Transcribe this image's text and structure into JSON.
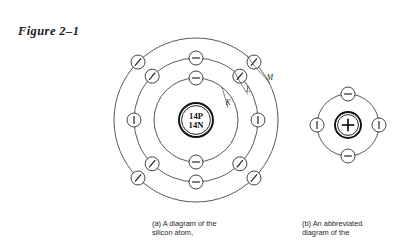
{
  "figure": {
    "label": "Figure 2–1"
  },
  "chart_data": {
    "type": "diagram",
    "title": "Figure 2–1",
    "subject": "silicon atom",
    "panels": [
      {
        "id": "a",
        "caption": "(a) A diagram of the\nsilicon atom,",
        "center": {
          "x": 196,
          "y": 120
        },
        "nucleus": {
          "line1": "14P",
          "line2": "14N",
          "radius": 17,
          "protons": 14,
          "neutrons": 14
        },
        "shells": [
          {
            "name": "K",
            "radius": 42,
            "electron_count": 2,
            "label": "K",
            "label_x": 228,
            "label_y": 105,
            "electrons": [
              {
                "angle": 270,
                "mark": "minus"
              },
              {
                "angle": 90,
                "mark": "minus"
              }
            ]
          },
          {
            "name": "L",
            "radius": 62,
            "electron_count": 8,
            "label": "L",
            "label_x": 248,
            "label_y": 92,
            "electrons": [
              {
                "angle": 270,
                "mark": "minus"
              },
              {
                "angle": 315,
                "mark": "slash"
              },
              {
                "angle": 0,
                "mark": "bar"
              },
              {
                "angle": 45,
                "mark": "slash"
              },
              {
                "angle": 90,
                "mark": "minus"
              },
              {
                "angle": 135,
                "mark": "slash"
              },
              {
                "angle": 180,
                "mark": "bar"
              },
              {
                "angle": 225,
                "mark": "slash"
              }
            ]
          },
          {
            "name": "M",
            "radius": 82,
            "electron_count": 4,
            "label": "M",
            "label_x": 270,
            "label_y": 80,
            "electrons": [
              {
                "angle": 225,
                "mark": "slash"
              },
              {
                "angle": 315,
                "mark": "slash"
              },
              {
                "angle": 45,
                "mark": "slash"
              },
              {
                "angle": 135,
                "mark": "slash"
              }
            ]
          }
        ]
      },
      {
        "id": "b",
        "caption": "(b) An abbreviated\ndiagram of the",
        "center": {
          "x": 348,
          "y": 125
        },
        "nucleus": {
          "symbol": "+",
          "radius": 13
        },
        "shells": [
          {
            "name": "valence",
            "radius": 31,
            "electron_count": 4,
            "electrons": [
              {
                "angle": 270,
                "mark": "minus"
              },
              {
                "angle": 0,
                "mark": "bar"
              },
              {
                "angle": 90,
                "mark": "minus"
              },
              {
                "angle": 180,
                "mark": "bar"
              }
            ]
          }
        ]
      }
    ],
    "electron_radius": 7
  },
  "colors": {
    "background": "#ffffff",
    "ink": "#1a1a1a",
    "shell_stroke": "#3b3b3b",
    "nucleus_stroke": "#111111"
  }
}
